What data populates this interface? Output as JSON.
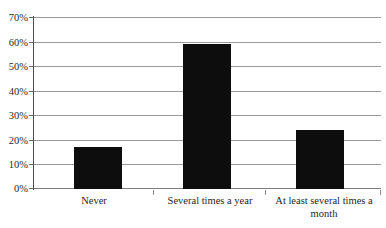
{
  "chart_data": {
    "type": "bar",
    "title": "",
    "subtitle": "",
    "xlabel": "",
    "ylabel": "",
    "categories": [
      "Never",
      "Several times a year",
      "At least several times a month"
    ],
    "values": [
      17,
      59,
      24
    ],
    "value_labels": [
      "17%",
      "59%",
      "24%"
    ],
    "ylim": [
      0,
      70
    ],
    "ytick_values": [
      0,
      10,
      20,
      30,
      40,
      50,
      60,
      70
    ],
    "ytick_labels": [
      "0%",
      "10%",
      "20%",
      "30%",
      "40%",
      "50%",
      "60%",
      "70%"
    ],
    "grid": true,
    "legend": false,
    "legend_position": "none",
    "series_color": "#0d0d0d",
    "gridline_color": "#9a9a9a",
    "axis_color": "#4a4a4a",
    "background_color": "#ffffff"
  }
}
